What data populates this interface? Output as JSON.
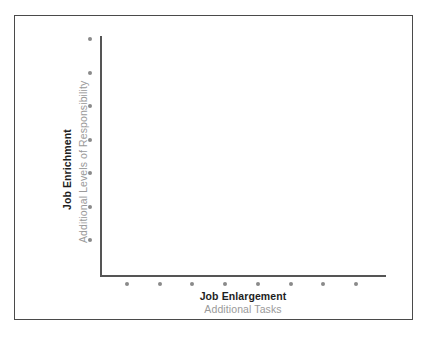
{
  "figure": {
    "background_color": "#ffffff",
    "frame_color": "#4a4a4a"
  },
  "chart_data": {
    "type": "scatter",
    "title": "",
    "subtitle": "",
    "xlabel": "Job Enlargement",
    "xlabel_sub": "Additional Tasks",
    "ylabel": "Job Enrichment",
    "ylabel_sub": "Additional Levels of Responsibility",
    "grid": false,
    "legend": null,
    "axis_color": "#555555",
    "marker_color": "#8a8a8a",
    "title_color": "#1e1e1e",
    "subtitle_color": "#9a9a9a",
    "xlim": [
      0,
      9
    ],
    "ylim": [
      0,
      8
    ],
    "x_axis_markers": {
      "count": 8,
      "values": [
        1,
        2,
        3,
        4,
        5,
        6,
        7,
        8
      ],
      "description": "eight evenly spaced dots below the horizontal axis"
    },
    "y_axis_markers": {
      "count": 7,
      "values": [
        1,
        2,
        3,
        4,
        5,
        6,
        7
      ],
      "description": "seven evenly spaced dots left of the vertical axis"
    },
    "series": [
      {
        "name": "x-axis progression markers",
        "orientation": "horizontal",
        "values": [
          1,
          2,
          3,
          4,
          5,
          6,
          7,
          8
        ]
      },
      {
        "name": "y-axis progression markers",
        "orientation": "vertical",
        "values": [
          1,
          2,
          3,
          4,
          5,
          6,
          7
        ]
      }
    ]
  }
}
